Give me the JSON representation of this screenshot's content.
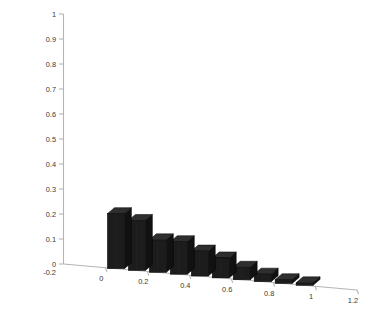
{
  "figure": {
    "background_color": "#ffffff",
    "axis_line_color": "#b4b4b4",
    "tick_label_color": "#3a3a3a",
    "bar_face_color": "#1c1c1c",
    "bar_top_color": "#2e2e2e",
    "bar_side_color": "#111111",
    "bar_edge_color": "#000000"
  },
  "chart_data": {
    "type": "bar",
    "title": "",
    "subtitle": "",
    "xlabel": "",
    "ylabel": "",
    "projection": "3d",
    "grid": false,
    "legend": null,
    "legend_position": "none",
    "xlim": [
      -0.2,
      1.2
    ],
    "ylim": [
      0,
      1
    ],
    "x_tick_labels": [
      "0",
      "0.2",
      "0.4",
      "0.6",
      "0.8",
      "1",
      "1.2"
    ],
    "x_tick_values": [
      0,
      0.2,
      0.4,
      0.6,
      0.8,
      1,
      1.2
    ],
    "x_axis_start_label": "-0.2",
    "y_tick_labels": [
      "0",
      "0.1",
      "0.2",
      "0.3",
      "0.4",
      "0.5",
      "0.6",
      "0.7",
      "0.8",
      "0.9",
      "1"
    ],
    "y_tick_values": [
      0,
      0.1,
      0.2,
      0.3,
      0.4,
      0.5,
      0.6,
      0.7,
      0.8,
      0.9,
      1
    ],
    "categories": [
      0.05,
      0.15,
      0.25,
      0.35,
      0.45,
      0.55,
      0.65,
      0.75,
      0.85,
      0.95
    ],
    "values": [
      0.22,
      0.2,
      0.13,
      0.13,
      0.1,
      0.08,
      0.05,
      0.03,
      0.015,
      0.01
    ]
  }
}
